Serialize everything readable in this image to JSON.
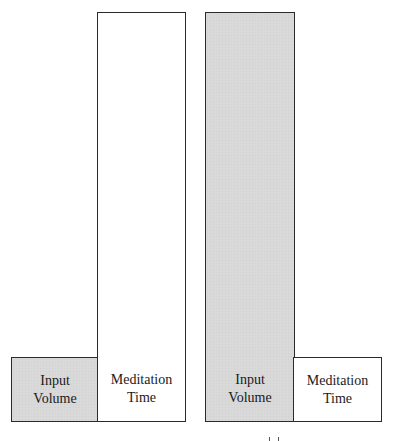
{
  "diagram": {
    "groups": [
      {
        "name": "left",
        "bars": [
          {
            "label": "Input\nVolume",
            "fill": "gray",
            "relative_height": "short"
          },
          {
            "label": "Meditation\nTime",
            "fill": "white",
            "relative_height": "tall"
          }
        ]
      },
      {
        "name": "right",
        "bars": [
          {
            "label": "Input\nVolume",
            "fill": "gray",
            "relative_height": "tall"
          },
          {
            "label": "Meditation\nTime",
            "fill": "white",
            "relative_height": "short"
          }
        ]
      }
    ],
    "colors": {
      "gray_fill": "#d9d9d9",
      "white_fill": "#ffffff",
      "border": "#2a2a2a"
    }
  }
}
